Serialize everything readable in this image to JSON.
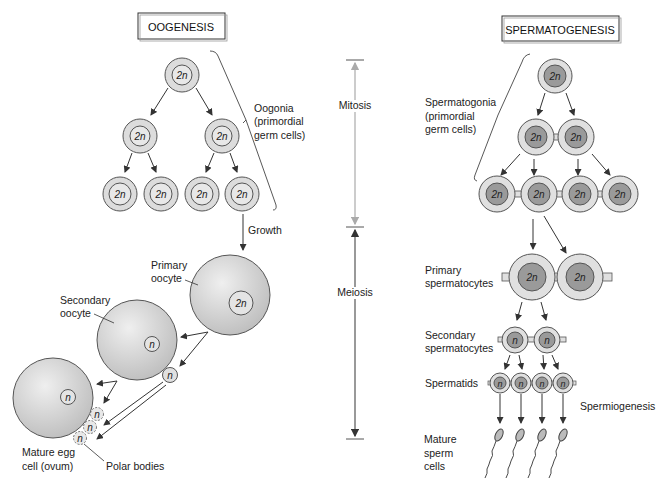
{
  "oogenesis": {
    "title": "OOGENESIS",
    "labels": {
      "oogonia": [
        "Oogonia",
        "(primordial",
        "germ cells)"
      ],
      "growth": "Growth",
      "primary_oocyte": [
        "Primary",
        "oocyte"
      ],
      "secondary_oocyte": [
        "Secondary",
        "oocyte"
      ],
      "mature_egg": [
        "Mature egg",
        "cell (ovum)"
      ],
      "polar_bodies": "Polar bodies"
    },
    "cell_labels": {
      "diploid": "2n",
      "haploid": "n"
    }
  },
  "center": {
    "mitosis": "Mitosis",
    "meiosis": "Meiosis"
  },
  "spermatogenesis": {
    "title": "SPERMATOGENESIS",
    "labels": {
      "spermatogonia": [
        "Spermatogonia",
        "(primordial",
        "germ cells)"
      ],
      "primary_spermatocytes": [
        "Primary",
        "spermatocytes"
      ],
      "secondary_spermatocytes": [
        "Secondary",
        "spermatocytes"
      ],
      "spermatids": "Spermatids",
      "spermiogenesis": "Spermiogenesis",
      "mature_sperm": [
        "Mature",
        "sperm",
        "cells"
      ]
    }
  },
  "colors": {
    "cell_outer": "#dcdcdc",
    "cell_inner_light": "#e6e6e6",
    "cell_inner_dark": "#9a9a9a",
    "stroke": "#555555",
    "mitosis_line": "#aaaaaa",
    "meiosis_line": "#555555"
  }
}
